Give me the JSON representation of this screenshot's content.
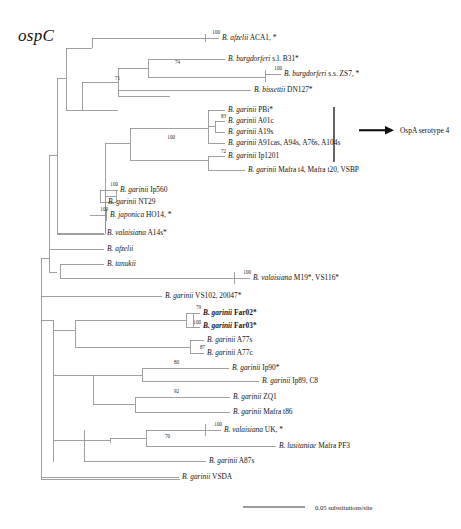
{
  "figure": {
    "gene_title": "ospC",
    "width": 461,
    "height": 529,
    "background_color": "#ffffff",
    "branch_color": "#8a8a8a",
    "text_color": "#141414"
  },
  "annotation": {
    "arrow_label": "OspA serotype 4",
    "arrow_icon": "right-arrow-icon",
    "bracket_icon": "vertical-bracket-icon"
  },
  "scale": {
    "label": "0.05 substitutions/site",
    "bar_length_px": 62
  },
  "taxa": [
    {
      "id": "t01",
      "genus": "B.",
      "species": "afzelii",
      "strain": "ACA1, *",
      "x": 222,
      "y": 38,
      "bold": false
    },
    {
      "id": "t02",
      "genus": "B.",
      "species": "burgdorferi",
      "strain": "s.l. B31*",
      "x": 228,
      "y": 59,
      "bold": false
    },
    {
      "id": "t03",
      "genus": "B.",
      "species": "burgdorferi",
      "strain": "s.s. ZS7, *",
      "x": 284,
      "y": 74,
      "bold": false
    },
    {
      "id": "t04",
      "genus": "B.",
      "species": "bissettii",
      "strain": "DN127*",
      "x": 254,
      "y": 90,
      "bold": false
    },
    {
      "id": "t05",
      "genus": "B.",
      "species": "garinii",
      "strain": "PBi*",
      "x": 228,
      "y": 110,
      "bold": false
    },
    {
      "id": "t06",
      "genus": "B.",
      "species": "garinii",
      "strain": "A01c",
      "x": 228,
      "y": 121,
      "bold": false
    },
    {
      "id": "t07",
      "genus": "B.",
      "species": "garinii",
      "strain": "A19s",
      "x": 228,
      "y": 132,
      "bold": false
    },
    {
      "id": "t08",
      "genus": "B.",
      "species": "garinii",
      "strain": "A91cas, A94s, A76s, A104s",
      "x": 228,
      "y": 143,
      "bold": false
    },
    {
      "id": "t09",
      "genus": "B.",
      "species": "garinii",
      "strain": "Ip1201",
      "x": 228,
      "y": 156,
      "bold": false
    },
    {
      "id": "t10",
      "genus": "B.",
      "species": "garinii",
      "strain": "Mafra t4, Mafra t20, VSBP",
      "x": 248,
      "y": 170,
      "bold": false
    },
    {
      "id": "t11",
      "genus": "B.",
      "species": "garinii",
      "strain": "Ip560",
      "x": 120,
      "y": 190,
      "bold": false
    },
    {
      "id": "t12",
      "genus": "B.",
      "species": "garinii",
      "strain": "NT29",
      "x": 108,
      "y": 202,
      "bold": false
    },
    {
      "id": "t13",
      "genus": "B.",
      "species": "japonica",
      "strain": "HO14, *",
      "x": 110,
      "y": 215,
      "bold": false
    },
    {
      "id": "t14",
      "genus": "B.",
      "species": "valaisiana",
      "strain": "A14s*",
      "x": 107,
      "y": 233,
      "bold": false
    },
    {
      "id": "t15",
      "genus": "B.",
      "species": "afzelii",
      "strain": "",
      "x": 107,
      "y": 249,
      "bold": false
    },
    {
      "id": "t16",
      "genus": "B.",
      "species": "tanukii",
      "strain": "",
      "x": 107,
      "y": 264,
      "bold": false
    },
    {
      "id": "t17",
      "genus": "B.",
      "species": "valaisiana",
      "strain": "M19*, VS116*",
      "x": 253,
      "y": 278,
      "bold": false
    },
    {
      "id": "t18",
      "genus": "B.",
      "species": "garinii",
      "strain": "VS102, 20047*",
      "x": 165,
      "y": 296,
      "bold": false
    },
    {
      "id": "t19",
      "genus": "B.",
      "species": "garinii",
      "strain": "Far02*",
      "x": 203,
      "y": 313,
      "bold": true
    },
    {
      "id": "t20",
      "genus": "B.",
      "species": "garinii",
      "strain": "Far03*",
      "x": 203,
      "y": 326,
      "bold": true
    },
    {
      "id": "t21",
      "genus": "B.",
      "species": "garinii",
      "strain": "A77s",
      "x": 207,
      "y": 340,
      "bold": false
    },
    {
      "id": "t22",
      "genus": "B.",
      "species": "garinii",
      "strain": "A77c",
      "x": 207,
      "y": 353,
      "bold": false
    },
    {
      "id": "t23",
      "genus": "B.",
      "species": "garinii",
      "strain": "Ip90*",
      "x": 232,
      "y": 368,
      "bold": false
    },
    {
      "id": "t24",
      "genus": "B.",
      "species": "garinii",
      "strain": "Ip89, C8",
      "x": 262,
      "y": 381,
      "bold": false
    },
    {
      "id": "t25",
      "genus": "B.",
      "species": "garinii",
      "strain": "ZQ1",
      "x": 233,
      "y": 397,
      "bold": false
    },
    {
      "id": "t26",
      "genus": "B.",
      "species": "garinii",
      "strain": "Mafra t86",
      "x": 233,
      "y": 412,
      "bold": false
    },
    {
      "id": "t27",
      "genus": "B.",
      "species": "valaisiana",
      "strain": "UK, *",
      "x": 224,
      "y": 430,
      "bold": false
    },
    {
      "id": "t28",
      "genus": "B.",
      "species": "lusitaniae",
      "strain": "Mafra PF3",
      "x": 279,
      "y": 446,
      "bold": false
    },
    {
      "id": "t29",
      "genus": "B.",
      "species": "garinii",
      "strain": "A87s",
      "x": 209,
      "y": 461,
      "bold": false
    },
    {
      "id": "t30",
      "genus": "B.",
      "species": "garinii",
      "strain": "VSDA",
      "x": 182,
      "y": 477,
      "bold": false
    }
  ],
  "bootstraps": [
    {
      "id": "b01",
      "value": "100",
      "x": 220,
      "y": 35
    },
    {
      "id": "b02",
      "value": "74",
      "x": 180,
      "y": 65
    },
    {
      "id": "b03",
      "value": "71",
      "x": 120,
      "y": 81
    },
    {
      "id": "b04",
      "value": "100",
      "x": 282,
      "y": 71
    },
    {
      "id": "b05",
      "value": "83",
      "x": 226,
      "y": 119
    },
    {
      "id": "b06",
      "value": "100",
      "x": 175,
      "y": 140
    },
    {
      "id": "b07",
      "value": "72",
      "x": 226,
      "y": 154
    },
    {
      "id": "b08",
      "value": "100",
      "x": 118,
      "y": 187
    },
    {
      "id": "b09",
      "value": "100",
      "x": 108,
      "y": 212
    },
    {
      "id": "b10",
      "value": "100",
      "x": 251,
      "y": 275
    },
    {
      "id": "b11",
      "value": "79",
      "x": 201,
      "y": 310
    },
    {
      "id": "b12",
      "value": "100",
      "x": 201,
      "y": 325
    },
    {
      "id": "b13",
      "value": "87",
      "x": 205,
      "y": 350
    },
    {
      "id": "b14",
      "value": "80",
      "x": 179,
      "y": 365
    },
    {
      "id": "b15",
      "value": "92",
      "x": 179,
      "y": 394
    },
    {
      "id": "b16",
      "value": "70",
      "x": 170,
      "y": 439
    },
    {
      "id": "b17",
      "value": "100",
      "x": 222,
      "y": 427
    }
  ]
}
